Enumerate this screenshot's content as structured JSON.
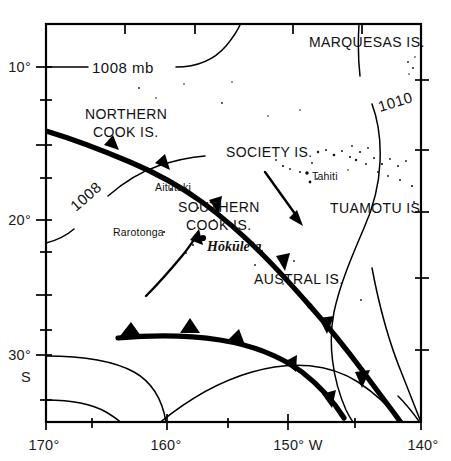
{
  "figure": {
    "type": "map",
    "background_color": "#ffffff",
    "line_color": "#000000"
  },
  "axes": {
    "x_axis": {
      "name": "longitude",
      "labels": [
        "170°",
        "160°",
        "150° W",
        "140°"
      ],
      "label_values": [
        -170,
        -160,
        -150,
        -140
      ],
      "minor_ticks_per_interval": 1
    },
    "y_axis": {
      "name": "latitude",
      "labels": [
        "10°",
        "20°",
        "30°"
      ],
      "label_values": [
        -10,
        -20,
        -30
      ],
      "hemisphere_label": "S",
      "minor_ticks_per_interval": 1
    }
  },
  "isobars": [
    {
      "id": "isobar-1008-north",
      "label": "1008 mb",
      "value": 1008,
      "units": "mb"
    },
    {
      "id": "isobar-1008-west",
      "label": "1008",
      "value": 1008,
      "units": "mb"
    },
    {
      "id": "isobar-1010-east",
      "label": "1010",
      "value": 1010,
      "units": "mb"
    },
    {
      "id": "isobar-south-1",
      "label": "",
      "value": null,
      "units": "mb"
    },
    {
      "id": "isobar-south-2",
      "label": "",
      "value": null,
      "units": "mb"
    },
    {
      "id": "isobar-southeast-1",
      "label": "",
      "value": null,
      "units": "mb"
    },
    {
      "id": "isobar-southeast-2",
      "label": "",
      "value": null,
      "units": "mb"
    }
  ],
  "fronts": [
    {
      "id": "front-north",
      "type": "cold-front",
      "barb_count": 4
    },
    {
      "id": "front-south",
      "type": "cold-front",
      "barb_count": 4
    }
  ],
  "island_groups": [
    {
      "name": "MARQUESAS IS.",
      "id": "marquesas"
    },
    {
      "name": "NORTHERN",
      "id": "northern-cook-line1"
    },
    {
      "name": "COOK IS.",
      "id": "northern-cook-line2"
    },
    {
      "name": "SOCIETY IS.",
      "id": "society"
    },
    {
      "name": "TUAMOTU IS.",
      "id": "tuamotu"
    },
    {
      "name": "SOUTHERN",
      "id": "southern-cook-line1"
    },
    {
      "name": "COOK IS.",
      "id": "southern-cook-line2"
    },
    {
      "name": "AUSTRAL IS.",
      "id": "austral"
    }
  ],
  "places": [
    {
      "name": "Aitutaki",
      "id": "aitutaki"
    },
    {
      "name": "Rarotonga",
      "id": "rarotonga"
    },
    {
      "name": "Tahiti",
      "id": "tahiti"
    }
  ],
  "vessel": {
    "name": "Hōkūleʻa",
    "id": "hokulea",
    "marker": "position-dot"
  },
  "arrows": [
    {
      "id": "vessel-track-arrow",
      "style": "curved",
      "direction": "northeast"
    },
    {
      "id": "wind-flow-arrow",
      "style": "straight",
      "direction": "southeast"
    }
  ]
}
